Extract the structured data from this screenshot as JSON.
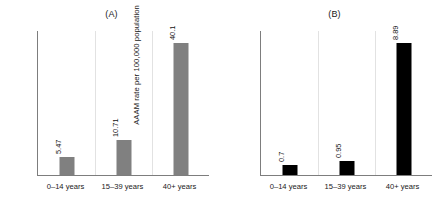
{
  "figure": {
    "width": 446,
    "height": 207,
    "background": "#ffffff"
  },
  "chart_data": [
    {
      "type": "bar",
      "title": "(A)",
      "xlabel": "",
      "ylabel": "AAAI rate per 100,000 population",
      "categories": [
        "0–14 years",
        "15–39 years",
        "40+  years"
      ],
      "values": [
        5.47,
        10.71,
        40.1
      ],
      "value_labels": [
        "5.47",
        "10.71",
        "40.1"
      ],
      "ylim": [
        0,
        44
      ],
      "grid": false,
      "legend": false,
      "bar_color": "#808080",
      "axis_color": "#7d7d7d",
      "label_rotation": 90
    },
    {
      "type": "bar",
      "title": "(B)",
      "xlabel": "",
      "ylabel": "AAAM rate per 100,000 population",
      "categories": [
        "0–14 years",
        "15–39 years",
        "40+  years"
      ],
      "values": [
        0.7,
        0.95,
        8.89
      ],
      "value_labels": [
        "0.7",
        "0.95",
        "8.89"
      ],
      "ylim": [
        0,
        9.8
      ],
      "grid": false,
      "legend": false,
      "bar_color": "#000000",
      "axis_color": "#7d7d7d",
      "label_rotation": 90
    }
  ]
}
